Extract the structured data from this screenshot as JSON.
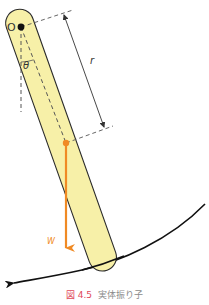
{
  "figure": {
    "labels": {
      "pivot": "O",
      "angle": "θ",
      "distance": "r",
      "weight": "W"
    },
    "caption": {
      "number": "図 4.5",
      "title": "実体振り子"
    },
    "colors": {
      "bar_fill": "#f7f0a8",
      "bar_stroke": "#2b2b2b",
      "weight_arrow": "#f08a24",
      "caption_number": "#e0485a",
      "caption_title": "#8a8a8a",
      "dashed_lines": "#555555",
      "swing_arc": "#111111"
    }
  }
}
